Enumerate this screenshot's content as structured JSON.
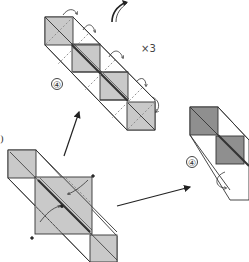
{
  "diagram": {
    "type": "origami-folding-instructions",
    "colors": {
      "paper_front": "#c9c9c9",
      "paper_dark": "#8f8f8f",
      "paper_white": "#ffffff",
      "line": "#333333",
      "valley_fold": "#777777"
    },
    "top_model": {
      "step_label": "④",
      "repeat_label": "×3",
      "description": "Long strip of 4 gray squares joined diagonally; curved arrows indicate folds repeated"
    },
    "bottom_left_model": {
      "step_label": ")",
      "description": "Gray square with two end squares, diagonal center crease, curved arrows fold inward"
    },
    "right_model": {
      "step_label": "④",
      "description": "Partially folded unit with dark shaded squares, cropped at edge"
    },
    "arrows": [
      {
        "from": "bottom_left_model",
        "to": "top_model",
        "kind": "straight"
      },
      {
        "from": "bottom_left_model",
        "to": "right_model",
        "kind": "straight"
      },
      {
        "from": "top",
        "to": "top",
        "kind": "curved-rotate"
      }
    ]
  }
}
